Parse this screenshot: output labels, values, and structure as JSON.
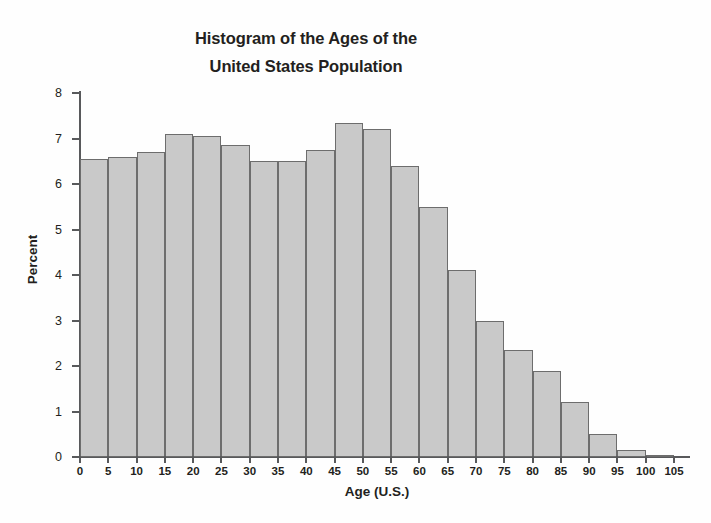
{
  "chart_data": {
    "type": "bar",
    "title": "Histogram of the Ages of the United States Population",
    "title_lines": [
      "Histogram of the Ages of the",
      "United States Population"
    ],
    "xlabel": "Age (U.S.)",
    "ylabel": "Percent",
    "xlim": [
      0,
      105
    ],
    "ylim": [
      0,
      8
    ],
    "grid": false,
    "legend": false,
    "bin_width": 5,
    "bar_fill_color": "#c9c9c9",
    "bar_border_color": "#6d6d6d",
    "axis_color": "#58595b",
    "x_ticks": [
      0,
      5,
      10,
      15,
      20,
      25,
      30,
      35,
      40,
      45,
      50,
      55,
      60,
      65,
      70,
      75,
      80,
      85,
      90,
      95,
      100,
      105
    ],
    "y_ticks": [
      0,
      1,
      2,
      3,
      4,
      5,
      6,
      7,
      8
    ],
    "bins": [
      {
        "range": "0-5",
        "start": 0,
        "end": 5,
        "value": 6.55
      },
      {
        "range": "5-10",
        "start": 5,
        "end": 10,
        "value": 6.6
      },
      {
        "range": "10-15",
        "start": 10,
        "end": 15,
        "value": 6.7
      },
      {
        "range": "15-20",
        "start": 15,
        "end": 20,
        "value": 7.1
      },
      {
        "range": "20-25",
        "start": 20,
        "end": 25,
        "value": 7.05
      },
      {
        "range": "25-30",
        "start": 25,
        "end": 30,
        "value": 6.85
      },
      {
        "range": "30-35",
        "start": 30,
        "end": 35,
        "value": 6.5
      },
      {
        "range": "35-40",
        "start": 35,
        "end": 40,
        "value": 6.5
      },
      {
        "range": "40-45",
        "start": 40,
        "end": 45,
        "value": 6.75
      },
      {
        "range": "45-50",
        "start": 45,
        "end": 50,
        "value": 7.35
      },
      {
        "range": "50-55",
        "start": 50,
        "end": 55,
        "value": 7.2
      },
      {
        "range": "55-60",
        "start": 55,
        "end": 60,
        "value": 6.4
      },
      {
        "range": "60-65",
        "start": 60,
        "end": 65,
        "value": 5.5
      },
      {
        "range": "65-70",
        "start": 65,
        "end": 70,
        "value": 4.1
      },
      {
        "range": "70-75",
        "start": 70,
        "end": 75,
        "value": 3.0
      },
      {
        "range": "75-80",
        "start": 75,
        "end": 80,
        "value": 2.35
      },
      {
        "range": "80-85",
        "start": 80,
        "end": 85,
        "value": 1.9
      },
      {
        "range": "85-90",
        "start": 85,
        "end": 90,
        "value": 1.2
      },
      {
        "range": "90-95",
        "start": 90,
        "end": 95,
        "value": 0.5
      },
      {
        "range": "95-100",
        "start": 95,
        "end": 100,
        "value": 0.15
      },
      {
        "range": "100-105",
        "start": 100,
        "end": 105,
        "value": 0.03
      }
    ]
  }
}
